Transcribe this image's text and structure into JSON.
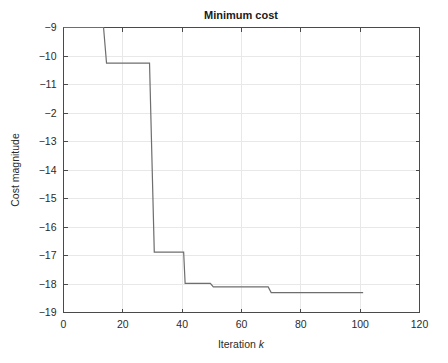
{
  "chart_data": {
    "type": "line",
    "title": "Minimum cost",
    "xlabel_prefix": "Iteration ",
    "xlabel_symbol": "k",
    "xlabel": "Iteration k",
    "ylabel": "Cost magnitude",
    "xlim": [
      0,
      120
    ],
    "ylim": [
      -19,
      -9
    ],
    "grid": true,
    "legend": null,
    "xticks": [
      0,
      20,
      40,
      60,
      80,
      100,
      120
    ],
    "xticklabels": [
      "0",
      "20",
      "40",
      "60",
      "80",
      "100",
      "120"
    ],
    "yticks": [
      -9,
      -10,
      -11,
      -12,
      -13,
      -14,
      -15,
      -16,
      -17,
      -18,
      -19
    ],
    "yticklabels": [
      "-9",
      "-10",
      "-11",
      "-2",
      "-13",
      "-14",
      "-15",
      "-16",
      "-17",
      "-18",
      "-19"
    ],
    "series": [
      {
        "name": "minimum cost",
        "color": "#6e6e6e",
        "step": "post",
        "x": [
          0,
          13.5,
          14.5,
          29,
          30.5,
          31,
          40.5,
          41,
          49.5,
          50.5,
          69,
          70,
          101
        ],
        "y": [
          -9,
          -9,
          -10.25,
          -10.25,
          -16.88,
          -16.88,
          -16.88,
          -17.98,
          -17.98,
          -18.1,
          -18.1,
          -18.3,
          -18.3
        ],
        "points": [
          {
            "x": 0,
            "y": -9
          },
          {
            "x": 13.5,
            "y": -9
          },
          {
            "x": 14.5,
            "y": -10.25
          },
          {
            "x": 29,
            "y": -10.25
          },
          {
            "x": 30.6,
            "y": -16.88
          },
          {
            "x": 40.5,
            "y": -16.88
          },
          {
            "x": 41,
            "y": -17.98
          },
          {
            "x": 49.5,
            "y": -17.98
          },
          {
            "x": 50.5,
            "y": -18.1
          },
          {
            "x": 69,
            "y": -18.1
          },
          {
            "x": 70,
            "y": -18.3
          },
          {
            "x": 101,
            "y": -18.3
          }
        ]
      }
    ],
    "annotations": []
  },
  "figure": {
    "background_color": "#ffffff",
    "axes_color": "#4a4a4a",
    "grid_color": "#e8e8e8",
    "line_color": "#6e6e6e"
  }
}
